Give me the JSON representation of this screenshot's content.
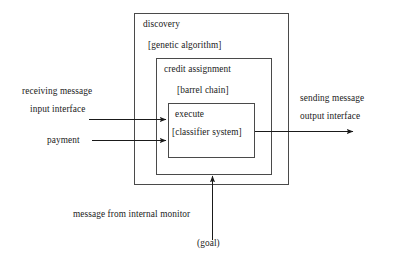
{
  "diagram": {
    "title": "",
    "boxes": [
      {
        "id": "outer",
        "label_main": "discovery",
        "label_sub": "[genetic algorithm]"
      },
      {
        "id": "middle",
        "label_main": "credit assignment",
        "label_sub": "[barrel chain]"
      },
      {
        "id": "inner",
        "label_main": "execute",
        "label_sub": "[classifier system]"
      }
    ],
    "left_labels": {
      "receiving_line1": "receiving message",
      "receiving_line2": "input interface",
      "payment": "payment"
    },
    "right_labels": {
      "sending_line1": "sending message",
      "sending_line2": "output interface"
    },
    "bottom_labels": {
      "monitor_message": "message from internal monitor",
      "goal": "(goal)"
    },
    "colors": {
      "stroke": "#4a4a4a",
      "arrow": "#1a1a1a",
      "text": "#1a1a1a",
      "background": "#ffffff"
    }
  }
}
